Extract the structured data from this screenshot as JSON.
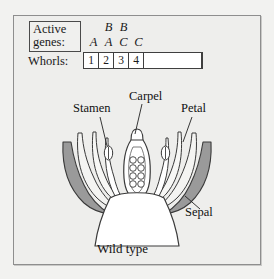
{
  "figure": {
    "caption": "Wild type",
    "legend": {
      "active_genes_label_line1": "Active",
      "active_genes_label_line2": "genes:",
      "whorls_label": "Whorls:"
    },
    "genes": {
      "top_row": [
        "",
        "B",
        "B",
        ""
      ],
      "bottom_row": [
        "A",
        "A",
        "C",
        "C"
      ]
    },
    "whorls": [
      "1",
      "2",
      "3",
      "4"
    ],
    "labels": {
      "stamen": "Stamen",
      "carpel": "Carpel",
      "petal": "Petal",
      "sepal": "Sepal"
    },
    "colors": {
      "page_background": "#f2f2f0",
      "frame_background": "#eeeeec",
      "frame_border": "#8e8e8e",
      "ink": "#1a1a1a",
      "sepal_fill": "#9c9c9c",
      "petal_fill": "#f7f7f5",
      "stamen_fill": "#ffffff",
      "carpel_fill": "#ffffff",
      "receptacle_fill": "#ffffff"
    }
  }
}
